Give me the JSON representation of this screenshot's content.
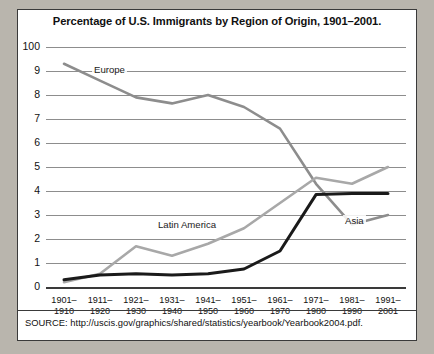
{
  "chart_data": {
    "type": "line",
    "title": "Percentage of U.S. Immigrants by Region of Origin, 1901–2001.",
    "xlabel": "",
    "ylabel": "",
    "grid": true,
    "legend_position": "inline-labels",
    "ylim": [
      0,
      10
    ],
    "ytick_labels": [
      "100",
      "9",
      "8",
      "7",
      "6",
      "5",
      "4",
      "3",
      "2",
      "1",
      "0"
    ],
    "ytick_values": [
      10,
      9,
      8,
      7,
      6,
      5,
      4,
      3,
      2,
      1,
      0
    ],
    "categories": [
      "1901–1910",
      "1911–1920",
      "1921–1930",
      "1931–1940",
      "1941–1950",
      "1951–1960",
      "1961–1970",
      "1971–1980",
      "1981–1990",
      "1991–2001"
    ],
    "series": [
      {
        "name": "Europe",
        "color": "#8d8d8d",
        "values": [
          9.3,
          8.6,
          7.9,
          7.65,
          8.0,
          7.5,
          6.6,
          4.3,
          2.6,
          3.0
        ]
      },
      {
        "name": "Latin America",
        "color": "#a8a8a8",
        "values": [
          0.2,
          0.55,
          1.7,
          1.3,
          1.8,
          2.45,
          3.5,
          4.55,
          4.3,
          5.0
        ]
      },
      {
        "name": "Asia",
        "color": "#1a1a1a",
        "values": [
          0.3,
          0.5,
          0.55,
          0.5,
          0.55,
          0.75,
          1.5,
          3.85,
          3.9,
          3.9
        ]
      }
    ],
    "annotations": [
      {
        "text": "Europe",
        "series": "Europe"
      },
      {
        "text": "Latin America",
        "series": "Latin America"
      },
      {
        "text": "Asia",
        "series": "Asia"
      }
    ]
  },
  "footer": {
    "source": "SOURCE: http://uscis.gov/graphics/shared/statistics/yearbook/Yearbook2004.pdf."
  }
}
